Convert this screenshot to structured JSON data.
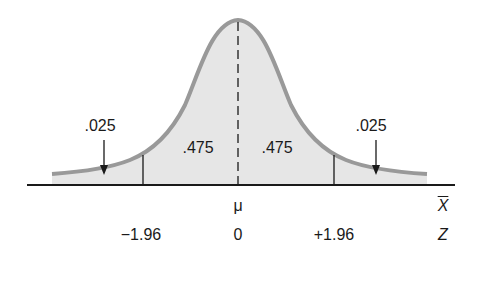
{
  "diagram": {
    "type": "normal-distribution",
    "title": "",
    "colors": {
      "curve_stroke": "#999999",
      "fill": "#e6e6e6",
      "axis": "#1a1a1a",
      "text": "#1a1a1a",
      "background": "#ffffff"
    },
    "regions": [
      {
        "name": "left-tail",
        "area_label": ".025",
        "from_z": null,
        "to_z": -1.96
      },
      {
        "name": "left-center",
        "area_label": ".475",
        "from_z": -1.96,
        "to_z": 0
      },
      {
        "name": "right-center",
        "area_label": ".475",
        "from_z": 0,
        "to_z": 1.96
      },
      {
        "name": "right-tail",
        "area_label": ".025",
        "from_z": 1.96,
        "to_z": null
      }
    ],
    "labels": {
      "left_tail": ".025",
      "left_center": ".475",
      "right_center": ".475",
      "right_tail": ".025"
    },
    "x_axis": {
      "mean_label": "μ",
      "axis_label": "X"
    },
    "z_axis": {
      "ticks": [
        "−1.96",
        "0",
        "+1.96"
      ],
      "axis_label": "Z"
    }
  }
}
